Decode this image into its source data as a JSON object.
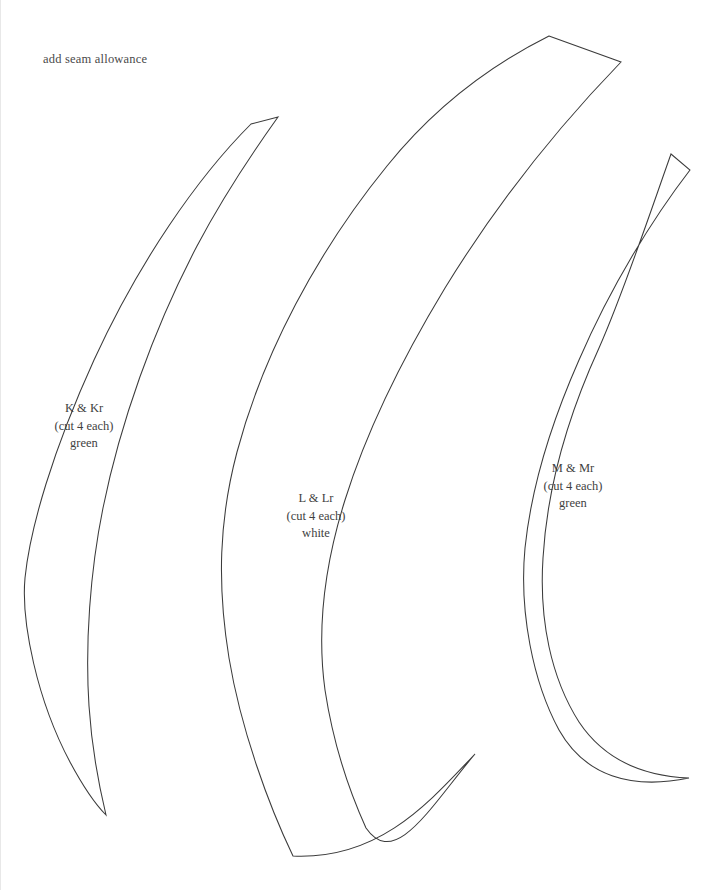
{
  "sheet": {
    "width": 725,
    "height": 890,
    "background": "#ffffff",
    "ink_color": "#3b3b3b",
    "text_color": "#4a4a4a"
  },
  "note": {
    "text": "add seam allowance",
    "x": 42,
    "y": 52
  },
  "pieces": [
    {
      "id": "piece-k",
      "name": "K & Kr",
      "cut": "(cut 4 each)",
      "fabric": "green",
      "label_x": 83,
      "label_y": 400,
      "path": "M 277 117 L 250 124 C 196 178 138 262 93 360 C 52 450 29 528 24 578 C 20 622 36 700 69 762 C 84 790 96 806 105 815 C 99 790 91 752 88 706 C 84 644 89 572 102 508 C 119 424 152 330 196 246 C 223 195 252 152 277 117 Z"
    },
    {
      "id": "piece-l",
      "name": "L & Lr",
      "cut": "(cut 4 each)",
      "fabric": "white",
      "label_x": 315,
      "label_y": 490,
      "path": "M 548 36 L 620 62 C 560 124 498 200 444 288 C 398 364 364 436 344 500 C 322 570 316 632 324 690 C 331 736 346 786 365 828 C 394 870 430 806 474 754 C 430 800 380 860 292 856 C 268 806 240 730 228 658 C 216 584 218 520 236 452 C 262 354 316 252 386 166 C 436 104 496 62 548 36 Z"
    },
    {
      "id": "piece-m",
      "name": "M & Mr",
      "cut": "(cut 4 each)",
      "fabric": "green",
      "label_x": 572,
      "label_y": 460,
      "path": "M 670 154 L 689 170 C 652 218 610 286 578 360 C 548 428 530 490 524 548 C 518 612 532 682 558 730 C 584 776 630 790 688 778 C 638 776 602 758 578 722 C 550 678 538 620 542 558 C 546 490 566 418 598 348 C 622 294 648 216 670 154 Z"
    }
  ]
}
